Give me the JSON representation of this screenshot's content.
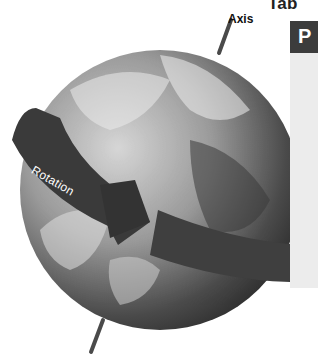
{
  "figure": {
    "labels": {
      "axis": "Axis",
      "rotation": "Rotation"
    },
    "icons": {
      "globe": "earth-globe-icon",
      "arrow": "rotation-arrow-icon",
      "axis_rod": "axis-rod-icon"
    },
    "colors": {
      "arrow": "#3a3a3a",
      "axis_rod": "#4a4a4a",
      "globe_dark": "#2e2e2e",
      "globe_light": "#bdbdbd"
    }
  },
  "table": {
    "heading_partial": "Tab",
    "header_partial": "P"
  }
}
